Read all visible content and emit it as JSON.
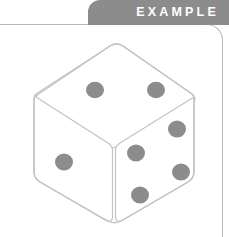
{
  "header": {
    "tab_label": "EXAMPLE",
    "tab_bg_color": "#8c8c8c",
    "tab_text_color": "#ffffff"
  },
  "panel": {
    "background_color": "#ffffff",
    "border_color": "#b9b9b9"
  },
  "illustration": {
    "name": "dice-illustration",
    "type": "isometric-cube-die",
    "outline_color": "#c3c3c3",
    "face_fill_color": "#ffffff",
    "pip_color": "#8c8c8c",
    "faces": [
      {
        "name": "top-face",
        "pip_count": 2
      },
      {
        "name": "left-face",
        "pip_count": 1
      },
      {
        "name": "right-face",
        "pip_count": 4
      }
    ],
    "total_visible_pips": 7
  }
}
